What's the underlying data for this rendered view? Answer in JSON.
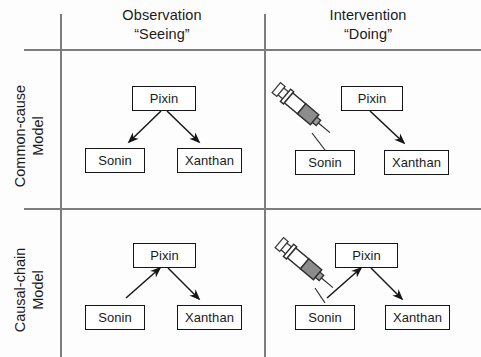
{
  "figure": {
    "type": "diagram",
    "background_color": "#fdfdfd",
    "rule_color": "#7d7d7d",
    "box_border_color": "#161616",
    "arrow_color": "#161616",
    "syringe_fill_color": "#8c8c8c"
  },
  "columns": [
    {
      "id": "observation",
      "line1": "Observation",
      "line2": "“Seeing”"
    },
    {
      "id": "intervention",
      "line1": "Intervention",
      "line2": "“Doing”"
    }
  ],
  "rows": [
    {
      "id": "common-cause",
      "line1": "Common-cause",
      "line2": "Model"
    },
    {
      "id": "causal-chain",
      "line1": "Causal-chain",
      "line2": "Model"
    }
  ],
  "panels": {
    "common_cause_observation": {
      "nodes": [
        {
          "id": "pixin",
          "label": "Pixin"
        },
        {
          "id": "sonin",
          "label": "Sonin"
        },
        {
          "id": "xanthan",
          "label": "Xanthan"
        }
      ],
      "edges": [
        {
          "from": "pixin",
          "to": "sonin"
        },
        {
          "from": "pixin",
          "to": "xanthan"
        }
      ],
      "syringe": false
    },
    "common_cause_intervention": {
      "nodes": [
        {
          "id": "pixin",
          "label": "Pixin"
        },
        {
          "id": "sonin",
          "label": "Sonin"
        },
        {
          "id": "xanthan",
          "label": "Xanthan"
        }
      ],
      "edges": [
        {
          "from": "pixin",
          "to": "xanthan"
        }
      ],
      "syringe": true,
      "syringe_target": "sonin"
    },
    "causal_chain_observation": {
      "nodes": [
        {
          "id": "pixin",
          "label": "Pixin"
        },
        {
          "id": "sonin",
          "label": "Sonin"
        },
        {
          "id": "xanthan",
          "label": "Xanthan"
        }
      ],
      "edges": [
        {
          "from": "sonin",
          "to": "pixin"
        },
        {
          "from": "pixin",
          "to": "xanthan"
        }
      ],
      "syringe": false
    },
    "causal_chain_intervention": {
      "nodes": [
        {
          "id": "pixin",
          "label": "Pixin"
        },
        {
          "id": "sonin",
          "label": "Sonin"
        },
        {
          "id": "xanthan",
          "label": "Xanthan"
        }
      ],
      "edges": [
        {
          "from": "sonin",
          "to": "pixin"
        },
        {
          "from": "pixin",
          "to": "xanthan"
        }
      ],
      "syringe": true,
      "syringe_target": "sonin"
    }
  }
}
